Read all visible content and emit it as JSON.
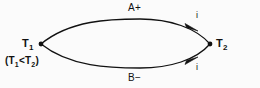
{
  "figure": {
    "type": "thermoelectric-circuit-diagram",
    "background_color": "#fbfbfb",
    "ink_color": "#111111",
    "nodes": [
      {
        "id": "junction-left",
        "symbol": "T",
        "subscript": "1",
        "x": 41,
        "y": 44
      },
      {
        "id": "junction-right",
        "symbol": "T",
        "subscript": "2",
        "x": 210,
        "y": 44
      }
    ],
    "branches": [
      {
        "id": "branch-upper",
        "label": "A+",
        "current_label": "i",
        "direction": "left-to-right"
      },
      {
        "id": "branch-lower",
        "label": "B−",
        "current_label": "i",
        "direction": "left-to-right"
      }
    ],
    "relation": {
      "open_paren": "(",
      "left_symbol": "T",
      "left_subscript": "1",
      "operator": "<",
      "right_symbol": "T",
      "right_subscript": "2",
      "close_paren": ")"
    },
    "geometry": {
      "left_vertex_x": 41,
      "left_vertex_y": 44,
      "right_vertex_x": 210,
      "right_vertex_y": 44,
      "upper_arc_peak_y": 19,
      "lower_arc_peak_y": 68,
      "upper_arrow_x": 193,
      "upper_arrow_y": 26,
      "lower_arrow_x": 193,
      "lower_arrow_y": 62,
      "stroke_width": 1.3,
      "node_radius": 2.4
    }
  }
}
